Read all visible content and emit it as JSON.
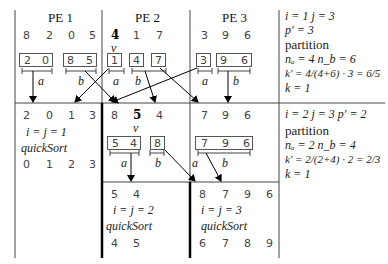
{
  "columns": {
    "pe1": {
      "title": "PE 1",
      "initial": [
        "8",
        "2",
        "0",
        "5"
      ]
    },
    "pe2": {
      "title": "PE 2",
      "initial": [
        "4",
        "1",
        "7"
      ],
      "pivot_label": "v"
    },
    "pe3": {
      "title": "PE 3",
      "initial": [
        "3",
        "9",
        "6"
      ]
    }
  },
  "level1": {
    "boxes": {
      "pe1_a": [
        "2",
        "0"
      ],
      "pe1_b": [
        "8",
        "5"
      ],
      "pe2_a": [
        "1"
      ],
      "pe2_b1": [
        "4"
      ],
      "pe2_b2": [
        "7"
      ],
      "pe3_a": [
        "3"
      ],
      "pe3_b": [
        "9",
        "6"
      ]
    },
    "labels": {
      "a": "a",
      "b": "b"
    }
  },
  "level2": {
    "left": {
      "values": [
        "2",
        "0",
        "1",
        "3"
      ],
      "note": "i = j = 1",
      "action": "quickSort",
      "sorted": [
        "0",
        "1",
        "2",
        "3"
      ]
    },
    "right_values": [
      "8",
      "5",
      "4",
      "7",
      "9",
      "6"
    ],
    "pivot_index_label": "v",
    "boxes": {
      "pe2_a": [
        "5",
        "4"
      ],
      "pe2_b": [
        "8"
      ],
      "pe3_a": [
        "7",
        "9",
        "6"
      ]
    }
  },
  "level3": {
    "pe2": {
      "values": [
        "5",
        "4"
      ],
      "note": "i = j = 2",
      "action": "quickSort",
      "sorted": [
        "4",
        "5"
      ]
    },
    "pe3": {
      "values": [
        "8",
        "7",
        "9",
        "6"
      ],
      "note": "i = j = 3",
      "action": "quickSort",
      "sorted": [
        "6",
        "7",
        "8",
        "9"
      ]
    }
  },
  "side_panel": {
    "step1": {
      "ij": "i = 1    j = 3",
      "p": "p′ = 3",
      "op": "partition",
      "n": "nₐ = 4  n_b = 6",
      "k_prime": "k′ = 4/(4+6) · 3 = 6/5",
      "k": "k = 1"
    },
    "step2": {
      "ij": "i = 2    j = 3 p′ = 2",
      "op": "partition",
      "n": "nₐ = 2  n_b = 4",
      "k_prime": "k′ = 2/(2+4) · 2 = 2/3",
      "k": "k = 1"
    }
  }
}
